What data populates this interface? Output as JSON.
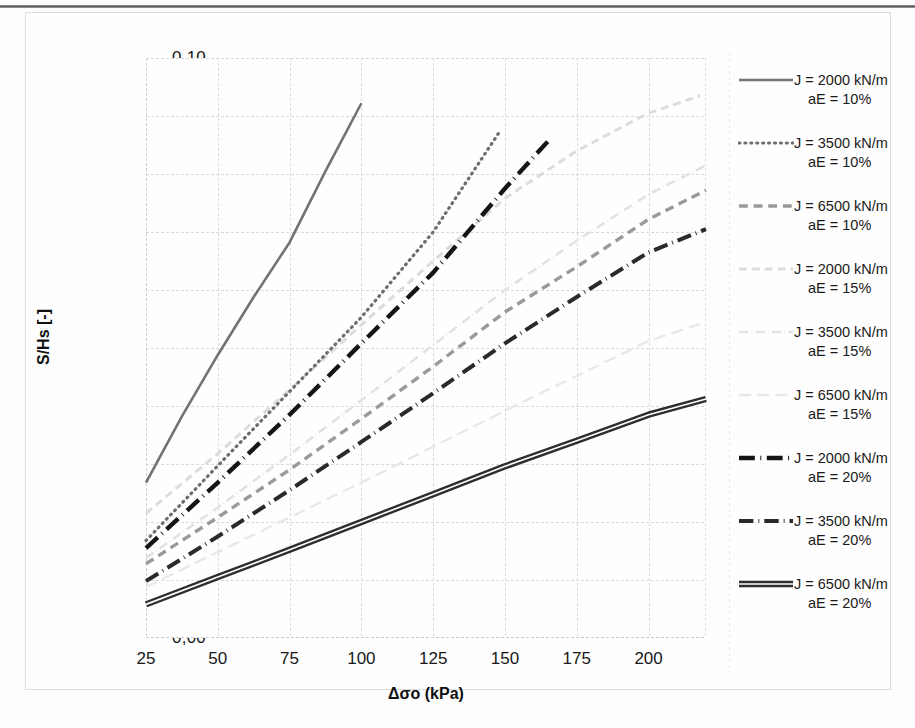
{
  "chart_data": {
    "type": "line",
    "title": "",
    "xlabel": "Δσo (kPa)",
    "ylabel": "S/Hs [-]",
    "xlim": [
      25,
      220
    ],
    "ylim": [
      0.0,
      0.1
    ],
    "xticks": [
      "25",
      "50",
      "75",
      "100",
      "125",
      "150",
      "175",
      "200"
    ],
    "xtick_values": [
      25,
      50,
      75,
      100,
      125,
      150,
      175,
      200
    ],
    "yticks": [
      "0,00",
      "0,01",
      "0,02",
      "0,03",
      "0,04",
      "0,05",
      "0,06",
      "0,07",
      "0,08",
      "0,09",
      "0,10"
    ],
    "ytick_values": [
      0.0,
      0.01,
      0.02,
      0.03,
      0.04,
      0.05,
      0.06,
      0.07,
      0.08,
      0.09,
      0.1
    ],
    "grid": true,
    "legend_position": "right",
    "series": [
      {
        "name": "J = 2000 kN/m aE = 10%",
        "label_line1": "J = 2000 kN/m",
        "label_line2": "aE = 10%",
        "color": "#737373",
        "style": "solid",
        "width": 2.6,
        "x": [
          25,
          37.5,
          50,
          62.5,
          75,
          87.5,
          100
        ],
        "y": [
          0.0268,
          0.0382,
          0.0488,
          0.0588,
          0.0682,
          0.0805,
          0.0922
        ]
      },
      {
        "name": "J = 3500 kN/m aE = 10%",
        "label_line1": "J = 3500 kN/m",
        "label_line2": "aE = 10%",
        "color": "#6e6e6e",
        "style": "dotted",
        "width": 3.2,
        "x": [
          25,
          50,
          75,
          100,
          125,
          148
        ],
        "y": [
          0.0168,
          0.0297,
          0.0425,
          0.0553,
          0.07,
          0.0872
        ]
      },
      {
        "name": "J = 6500 kN/m aE = 10%",
        "label_line1": "J = 6500 kN/m",
        "label_line2": "aE = 10%",
        "color": "#9a9a9a",
        "style": "dashed",
        "width": 3.4,
        "x": [
          25,
          50,
          75,
          100,
          125,
          150,
          175,
          200,
          220
        ],
        "y": [
          0.0128,
          0.0208,
          0.029,
          0.0378,
          0.0468,
          0.0562,
          0.064,
          0.0722,
          0.0772
        ]
      },
      {
        "name": "J = 2000 kN/m aE = 15%",
        "label_line1": "J = 2000 kN/m",
        "label_line2": "aE = 15%",
        "color": "#dcdcdc",
        "style": "dashed",
        "width": 3.0,
        "x": [
          25,
          50,
          75,
          100,
          125,
          150,
          175,
          200,
          218
        ],
        "y": [
          0.0215,
          0.0318,
          0.0428,
          0.054,
          0.065,
          0.0758,
          0.084,
          0.0905,
          0.0935
        ]
      },
      {
        "name": "J = 3500 kN/m aE = 15%",
        "label_line1": "J = 3500 kN/m",
        "label_line2": "aE = 15%",
        "color": "#e2e2e2",
        "style": "dashdot",
        "width": 2.6,
        "x": [
          25,
          50,
          75,
          100,
          125,
          150,
          175,
          200,
          220
        ],
        "y": [
          0.0138,
          0.0225,
          0.0316,
          0.041,
          0.0505,
          0.06,
          0.0685,
          0.0765,
          0.0815
        ]
      },
      {
        "name": "J = 6500 kN/m aE = 15%",
        "label_line1": "J = 6500 kN/m",
        "label_line2": "aE = 15%",
        "color": "#e8e8e8",
        "style": "longdash",
        "width": 2.4,
        "x": [
          25,
          50,
          75,
          100,
          125,
          150,
          175,
          200,
          220
        ],
        "y": [
          0.0088,
          0.0148,
          0.0208,
          0.0268,
          0.033,
          0.0392,
          0.0452,
          0.0512,
          0.0545
        ]
      },
      {
        "name": "J = 2000 kN/m aE = 20%",
        "label_line1": "J = 2000 kN/m",
        "label_line2": "aE = 20%",
        "color": "#151515",
        "style": "dashdot",
        "width": 4.4,
        "x": [
          25,
          50,
          75,
          100,
          125,
          150,
          166
        ],
        "y": [
          0.0155,
          0.0268,
          0.0385,
          0.0508,
          0.063,
          0.0775,
          0.0862
        ]
      },
      {
        "name": "J = 3500 kN/m aE = 20%",
        "label_line1": "J = 3500 kN/m",
        "label_line2": "aE = 20%",
        "color": "#2a2a2a",
        "style": "dashdot",
        "width": 4.0,
        "x": [
          25,
          50,
          75,
          100,
          125,
          150,
          175,
          200,
          220
        ],
        "y": [
          0.0098,
          0.0175,
          0.0255,
          0.0338,
          0.0422,
          0.0508,
          0.0588,
          0.0665,
          0.0705
        ]
      },
      {
        "name": "J = 6500 kN/m aE = 20%",
        "label_line1": "J = 6500 kN/m",
        "label_line2": "aE = 20%",
        "color": "#2e2e2e",
        "style": "doubleline",
        "width": 2.2,
        "x": [
          25,
          50,
          75,
          100,
          125,
          150,
          175,
          200,
          220
        ],
        "y": [
          0.0058,
          0.0105,
          0.0152,
          0.02,
          0.0248,
          0.0296,
          0.034,
          0.0385,
          0.0412
        ]
      }
    ]
  },
  "axes": {
    "ylabel": "S/Hs [-]",
    "xlabel": "Δσo (kPa)",
    "ytick_0": "0,00",
    "ytick_1": "0,01",
    "ytick_2": "0,02",
    "ytick_3": "0,03",
    "ytick_4": "0,04",
    "ytick_5": "0,05",
    "ytick_6": "0,06",
    "ytick_7": "0,07",
    "ytick_8": "0,08",
    "ytick_9": "0,09",
    "ytick_10": "0,10",
    "xtick_0": "25",
    "xtick_1": "50",
    "xtick_2": "75",
    "xtick_3": "100",
    "xtick_4": "125",
    "xtick_5": "150",
    "xtick_6": "175",
    "xtick_7": "200"
  }
}
